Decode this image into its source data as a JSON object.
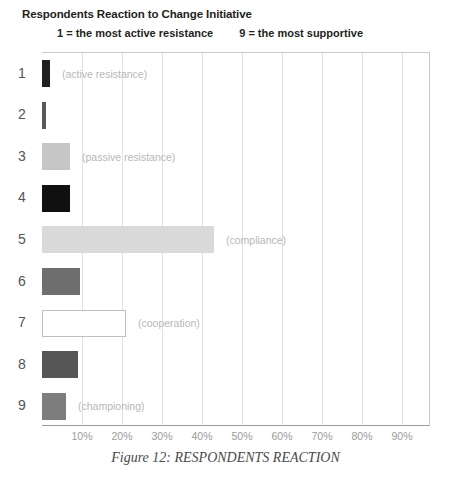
{
  "chart_data": {
    "type": "bar",
    "orientation": "horizontal",
    "title": "Respondents Reaction to Change Initiative",
    "subtitle_left": "1 = the most active resistance",
    "subtitle_right": "9 = the most supportive",
    "caption": "Figure 12: RESPONDENTS REACTION",
    "xlabel": "",
    "ylabel": "",
    "xlim": [
      0,
      97
    ],
    "grid": true,
    "legend": "none",
    "categories": [
      "1",
      "2",
      "3",
      "4",
      "5",
      "6",
      "7",
      "8",
      "9"
    ],
    "values": [
      2,
      1,
      7,
      7,
      43,
      9.5,
      21,
      9,
      6
    ],
    "xticks": [
      10,
      20,
      30,
      40,
      50,
      60,
      70,
      80,
      90
    ],
    "xticklabels": [
      "10%",
      "20%",
      "30%",
      "40%",
      "50%",
      "60%",
      "70%",
      "80%",
      "90%"
    ],
    "bars": [
      {
        "category": "1",
        "value": 2,
        "note": "(active resistance)",
        "fill": "#231f20",
        "border": "#231f20"
      },
      {
        "category": "2",
        "value": 1,
        "note": "",
        "fill": "#58595b",
        "border": "#58595b"
      },
      {
        "category": "3",
        "value": 7,
        "note": "(passive resistance)",
        "fill": "#c6c6c6",
        "border": "#c6c6c6"
      },
      {
        "category": "4",
        "value": 7,
        "note": "",
        "fill": "#101010",
        "border": "#101010"
      },
      {
        "category": "5",
        "value": 43,
        "note": "(compliance)",
        "fill": "#dadada",
        "border": "#dadada"
      },
      {
        "category": "6",
        "value": 9.5,
        "note": "",
        "fill": "#6e6e6e",
        "border": "#6e6e6e"
      },
      {
        "category": "7",
        "value": 21,
        "note": "(cooperation)",
        "fill": "#ffffff",
        "border": "#c0c0c0"
      },
      {
        "category": "8",
        "value": 9,
        "note": "",
        "fill": "#565656",
        "border": "#565656"
      },
      {
        "category": "9",
        "value": 6,
        "note": "(championing)",
        "fill": "#7d7d7d",
        "border": "#7d7d7d"
      }
    ]
  }
}
